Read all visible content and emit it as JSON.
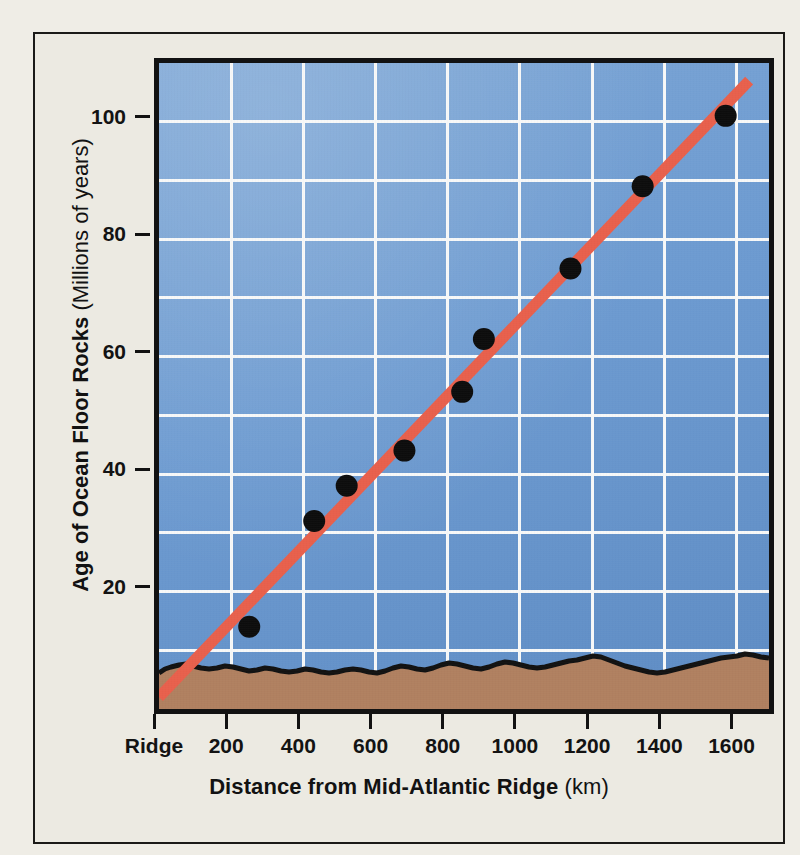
{
  "figure": {
    "background_color": "#efede6",
    "frame_color": "#1b1a18"
  },
  "chart_data": {
    "type": "scatter",
    "title": "",
    "xlabel": "Distance from Mid-Atlantic Ridge",
    "xunit": "(km)",
    "ylabel": "Age of Ocean Floor Rocks",
    "yunit": "(Millions of years)",
    "xlim": [
      0,
      1690
    ],
    "ylim": [
      0,
      110
    ],
    "xticks": [
      0,
      200,
      400,
      600,
      800,
      1000,
      1200,
      1400,
      1600
    ],
    "xticklabels": [
      "Ridge",
      "200",
      "400",
      "600",
      "800",
      "1000",
      "1200",
      "1400",
      "1600"
    ],
    "yticks": [
      20,
      40,
      60,
      80,
      100
    ],
    "yticklabels": [
      "20",
      "40",
      "60",
      "80",
      "100"
    ],
    "x_gridlines": [
      200,
      400,
      600,
      800,
      1000,
      1200,
      1400,
      1600
    ],
    "y_gridlines": [
      10,
      20,
      30,
      40,
      50,
      60,
      70,
      80,
      90,
      100
    ],
    "grid": true,
    "legend": "none",
    "series": [
      {
        "name": "Ocean floor rock samples",
        "marker": "filled-circle",
        "marker_color": "#0d0d0d",
        "points": [
          {
            "x": 250,
            "y": 14
          },
          {
            "x": 430,
            "y": 32
          },
          {
            "x": 520,
            "y": 38
          },
          {
            "x": 680,
            "y": 44
          },
          {
            "x": 840,
            "y": 54
          },
          {
            "x": 900,
            "y": 63
          },
          {
            "x": 1140,
            "y": 75
          },
          {
            "x": 1340,
            "y": 89
          },
          {
            "x": 1570,
            "y": 101
          }
        ]
      },
      {
        "name": "Best-fit trend line",
        "marker": "none",
        "line_color": "#e8604c",
        "line": [
          {
            "x": 0,
            "y": 2
          },
          {
            "x": 1635,
            "y": 107
          }
        ]
      }
    ],
    "annotations": [
      {
        "name": "seafloor-profile",
        "fill_color": "#b08060",
        "outline_color": "#121212"
      }
    ],
    "plot_background_color": "#6d9bd1"
  }
}
